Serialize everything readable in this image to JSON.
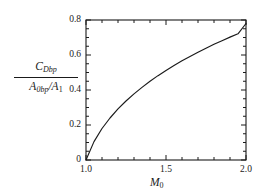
{
  "figure": {
    "background_color": "#ffffff",
    "line_color": "#1a1a1a",
    "axis_color": "#1a1a1a"
  },
  "axis_labels": {
    "y_numerator_main": "C",
    "y_numerator_sub": "Dbp",
    "y_denominator_main_1": "A",
    "y_denominator_sub_1": "0bp",
    "y_denominator_slash": "/",
    "y_denominator_main_2": "A",
    "y_denominator_sub_2": "1",
    "x_main": "M",
    "x_sub": "0"
  },
  "ticks": {
    "y": [
      "0",
      "0.2",
      "0.4",
      "0.6",
      "0.8"
    ],
    "x": [
      "1.0",
      "1.5",
      "2.0"
    ]
  },
  "chart_data": {
    "type": "line",
    "title": "",
    "xlabel": "M_0",
    "ylabel": "C_Dbp / (A_0bp / A_1)",
    "xlim": [
      1.0,
      2.0
    ],
    "ylim": [
      0.0,
      0.8
    ],
    "xticks": [
      1.0,
      1.5,
      2.0
    ],
    "yticks": [
      0.0,
      0.2,
      0.4,
      0.6,
      0.8
    ],
    "x_minor_tick_step": 0.1,
    "y_minor_tick_step": 0.05,
    "grid": false,
    "legend": false,
    "series": [
      {
        "name": "C_Dbp/(A_0bp/A_1)",
        "x": [
          1.0,
          1.05,
          1.1,
          1.15,
          1.2,
          1.25,
          1.3,
          1.35,
          1.4,
          1.45,
          1.5,
          1.55,
          1.6,
          1.65,
          1.7,
          1.75,
          1.8,
          1.85,
          1.9,
          1.95,
          2.0
        ],
        "y": [
          0.0,
          0.105,
          0.18,
          0.24,
          0.292,
          0.337,
          0.378,
          0.415,
          0.45,
          0.482,
          0.512,
          0.54,
          0.567,
          0.592,
          0.616,
          0.639,
          0.661,
          0.682,
          0.702,
          0.721,
          0.78
        ]
      }
    ]
  }
}
